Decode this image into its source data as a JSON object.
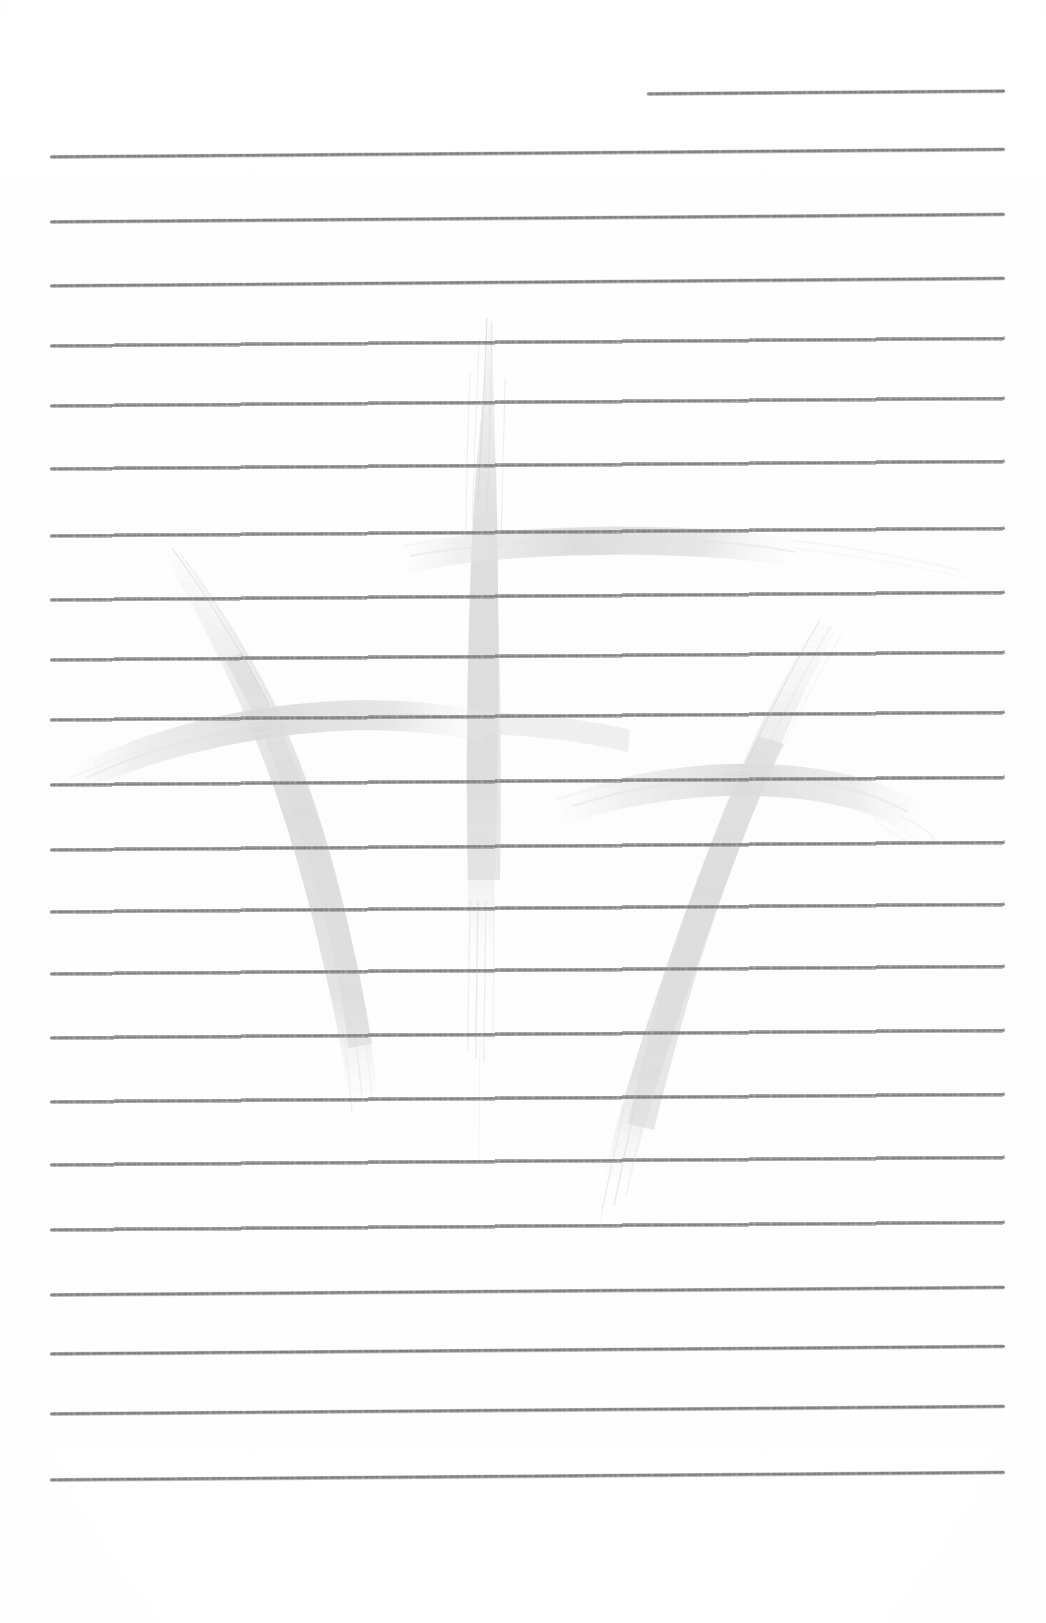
{
  "document": {
    "kind": "scanned-lined-notebook-page",
    "title": "Lined notebook page",
    "background_color": "#ffffff",
    "width": 1046,
    "height": 1623,
    "content_text": "",
    "notes": "Blank ruled writing paper, no handwriting present"
  },
  "ruling": {
    "line_color": "#808080",
    "line_thickness_px": 4,
    "line_spacing_px": 65,
    "line_count": 23,
    "left_margin_px": 53,
    "right_margin_px": 1003,
    "tilt_degrees": -0.45,
    "lines": [
      {
        "index": 1,
        "x": 647,
        "y": 92,
        "width": 358,
        "partial": true
      },
      {
        "index": 2,
        "x": 50,
        "y": 155,
        "width": 955,
        "partial": false
      },
      {
        "index": 3,
        "x": 50,
        "y": 220,
        "width": 955,
        "partial": false
      },
      {
        "index": 4,
        "x": 50,
        "y": 284,
        "width": 955,
        "partial": false
      },
      {
        "index": 5,
        "x": 50,
        "y": 344,
        "width": 955,
        "partial": false
      },
      {
        "index": 6,
        "x": 50,
        "y": 404,
        "width": 955,
        "partial": false
      },
      {
        "index": 7,
        "x": 50,
        "y": 467,
        "width": 955,
        "partial": false
      },
      {
        "index": 8,
        "x": 50,
        "y": 534,
        "width": 955,
        "partial": false
      },
      {
        "index": 9,
        "x": 50,
        "y": 598,
        "width": 955,
        "partial": false
      },
      {
        "index": 10,
        "x": 50,
        "y": 658,
        "width": 955,
        "partial": false
      },
      {
        "index": 11,
        "x": 50,
        "y": 718,
        "width": 955,
        "partial": false
      },
      {
        "index": 12,
        "x": 50,
        "y": 783,
        "width": 955,
        "partial": false
      },
      {
        "index": 13,
        "x": 50,
        "y": 848,
        "width": 955,
        "partial": false
      },
      {
        "index": 14,
        "x": 50,
        "y": 910,
        "width": 955,
        "partial": false
      },
      {
        "index": 15,
        "x": 50,
        "y": 972,
        "width": 955,
        "partial": false
      },
      {
        "index": 16,
        "x": 50,
        "y": 1036,
        "width": 955,
        "partial": false
      },
      {
        "index": 17,
        "x": 50,
        "y": 1100,
        "width": 955,
        "partial": false
      },
      {
        "index": 18,
        "x": 50,
        "y": 1163,
        "width": 955,
        "partial": false
      },
      {
        "index": 19,
        "x": 50,
        "y": 1228,
        "width": 955,
        "partial": false
      },
      {
        "index": 20,
        "x": 50,
        "y": 1293,
        "width": 955,
        "partial": false
      },
      {
        "index": 21,
        "x": 50,
        "y": 1352,
        "width": 955,
        "partial": false
      },
      {
        "index": 22,
        "x": 50,
        "y": 1412,
        "width": 955,
        "partial": false
      },
      {
        "index": 23,
        "x": 50,
        "y": 1478,
        "width": 955,
        "partial": false
      }
    ]
  },
  "watermark": {
    "name": "brush-calligraphy-watermark",
    "description": "Faint light-gray calligraphic brush character with a tall central vertical stroke, a left descending hook stroke with horizontal crossbar, and a right descending stroke with horizontal crossbar",
    "color": "#dcdcdc",
    "opacity": 0.85,
    "bounding_box": {
      "x": 70,
      "y": 310,
      "width": 870,
      "height": 900
    },
    "strokes": [
      {
        "id": "center-vertical",
        "label": "central vertical brush stroke"
      },
      {
        "id": "center-horizontal",
        "label": "central horizontal crossbar"
      },
      {
        "id": "left-vertical",
        "label": "left curved descending stroke"
      },
      {
        "id": "left-horizontal",
        "label": "left horizontal sweep"
      },
      {
        "id": "right-vertical",
        "label": "right curved descending stroke"
      },
      {
        "id": "right-horizontal",
        "label": "right horizontal sweep"
      }
    ]
  }
}
